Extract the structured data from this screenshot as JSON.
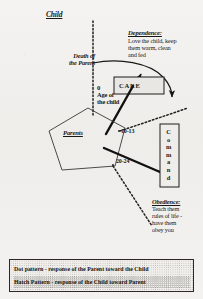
{
  "diagram": {
    "title_top": "Child",
    "death_label": "Death of\nthe Parent",
    "axis_zero": "0",
    "axis_label": "Age of\nthe child",
    "care_box": "CARE",
    "pentagon_label": "Parents",
    "age_marker_1": "10-13",
    "age_marker_2": "20-24",
    "command_box": "C\no\nm\nm\na\nn\nd",
    "dependence": {
      "heading": "Dependence:",
      "body": "Love the child, keep\nthem warm, clean\nand fed"
    },
    "obedience": {
      "heading": "Obedience:",
      "body": "Teach them\nrules of life -\nhave them\nobey you"
    }
  },
  "legend": {
    "rows": [
      "Dot pattern - response of the Parent toward the Child",
      "Hatch Pattern - response of the Child toward Parent"
    ]
  },
  "colors": {
    "ink": "#1a1815",
    "paper": "#f2f1ef",
    "box_fill": "#e8e7e3"
  }
}
